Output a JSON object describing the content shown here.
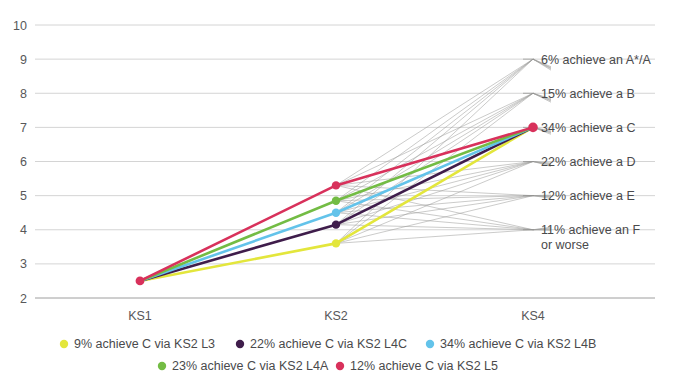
{
  "chart_data": {
    "type": "line",
    "title": "",
    "subtitle": "",
    "xlabel": "",
    "ylabel": "",
    "categories": [
      "KS1",
      "KS2",
      "KS4"
    ],
    "ylim": [
      2,
      10
    ],
    "yticks": [
      2,
      3,
      4,
      5,
      6,
      7,
      8,
      9,
      10
    ],
    "ytick_labels": [
      "2",
      "3",
      "4",
      "5",
      "6",
      "7",
      "8",
      "9",
      "10"
    ],
    "grid": true,
    "legend_position": "bottom",
    "series": [
      {
        "name": "9% achieve C via KS2 L3",
        "color": "#e3e63c",
        "values": [
          2.5,
          3.6,
          7.0
        ]
      },
      {
        "name": "22% achieve C via KS2 L4C",
        "color": "#3f1d4b",
        "values": [
          2.5,
          4.15,
          7.0
        ]
      },
      {
        "name": "34% achieve C via KS2 L4B",
        "color": "#63c3ea",
        "values": [
          2.5,
          4.5,
          7.0
        ]
      },
      {
        "name": "23% achieve C via KS2 L4A",
        "color": "#73bc44",
        "values": [
          2.5,
          4.85,
          7.0
        ]
      },
      {
        "name": "12% achieve C via KS2 L5",
        "color": "#d8315b",
        "values": [
          2.5,
          5.3,
          7.0
        ]
      }
    ],
    "fan_targets": [
      9,
      8,
      7,
      6,
      5,
      4
    ],
    "annotations": [
      {
        "y": 9,
        "text": "6% achieve an A*/A"
      },
      {
        "y": 8,
        "text": "15% achieve a B"
      },
      {
        "y": 7,
        "text": "34% achieve a C"
      },
      {
        "y": 6,
        "text": "22% achieve a D"
      },
      {
        "y": 5,
        "text": "12% achieve a E"
      },
      {
        "y": 4,
        "text": "11% achieve an F",
        "text2": "or worse"
      }
    ],
    "highlight_marker": {
      "x_category": "KS4",
      "y": 7,
      "color": "#d8315b"
    },
    "colors": {
      "grid": "#c9c9c9",
      "fan": "#9a9a99",
      "text": "#4a4a4c",
      "background": "#ffffff"
    }
  },
  "axis": {
    "ks1_label": "KS1",
    "ks2_label": "KS2",
    "ks4_label": "KS4"
  },
  "legend": {
    "items": [
      {
        "label": "9% achieve C via KS2 L3",
        "color": "#e3e63c"
      },
      {
        "label": "22% achieve C via KS2 L4C",
        "color": "#3f1d4b"
      },
      {
        "label": "34% achieve C via KS2 L4B",
        "color": "#63c3ea"
      },
      {
        "label": "23% achieve C via KS2 L4A",
        "color": "#73bc44"
      },
      {
        "label": "12% achieve C via KS2 L5",
        "color": "#d8315b"
      }
    ]
  }
}
